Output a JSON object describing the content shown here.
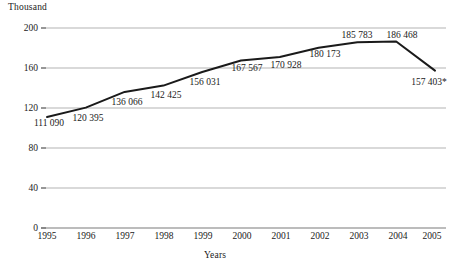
{
  "chart_data": {
    "type": "line",
    "title": "",
    "ylabel": "Thousand",
    "xlabel": "Years",
    "categories": [
      "1995",
      "1996",
      "1997",
      "1998",
      "1999",
      "2000",
      "2001",
      "2002",
      "2003",
      "2004",
      "2005"
    ],
    "values": [
      111090,
      120395,
      136066,
      142425,
      156031,
      167567,
      170928,
      180173,
      185783,
      186468,
      157403
    ],
    "value_labels": [
      "111 090",
      "120 395",
      "136 066",
      "142 425",
      "156 031",
      "167 567",
      "170 928",
      "180 173",
      "185 783",
      "186 468",
      "157 403*"
    ],
    "ylim": [
      0,
      200
    ],
    "yticks": [
      0,
      40,
      80,
      120,
      160,
      200
    ],
    "ytick_labels": [
      "0",
      "40",
      "80",
      "120",
      "160",
      "200"
    ],
    "grid": true,
    "grid_axis": "y",
    "legend": "none",
    "units": "thousand",
    "series_color": "#1a1a1a",
    "grid_color": "#b0b0b0",
    "axis_color": "#6a6a6a"
  }
}
